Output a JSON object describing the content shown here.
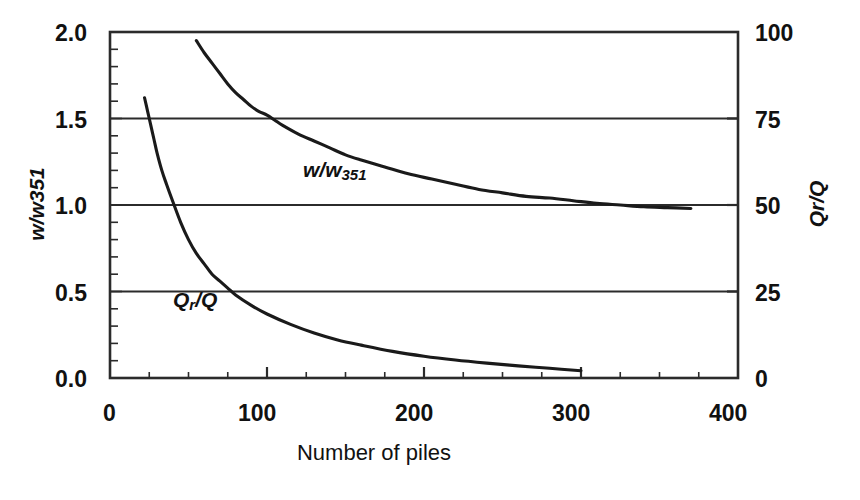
{
  "chart_data": {
    "type": "line",
    "title": "",
    "xlabel": "Number of piles",
    "ylabel_left": "w/w351",
    "ylabel_right": "Qr/Q",
    "xlim": [
      0,
      400
    ],
    "ylim_left": [
      0.0,
      2.0
    ],
    "ylim_right": [
      0,
      100
    ],
    "xticks": [
      0,
      100,
      200,
      300,
      400
    ],
    "xticklabels": [
      "0",
      "100",
      "200",
      "300",
      "400"
    ],
    "yticks_left": [
      0.0,
      0.5,
      1.0,
      1.5,
      2.0
    ],
    "yticklabels_left": [
      "0.0",
      "0.5",
      "1.0",
      "1.5",
      "2.0"
    ],
    "yticks_right": [
      0,
      25,
      50,
      75,
      100
    ],
    "yticklabels_right": [
      "0",
      "25",
      "50",
      "75",
      "100"
    ],
    "x_minor_tick_step": 25,
    "y_minor_tick_step_left": 0.1,
    "grid": "horizontal gridlines at left-axis 0.5, 1.0, 1.5",
    "gridlines_left": [
      0.5,
      1.0,
      1.5
    ],
    "legend": "inline curve annotations",
    "line_color": "#1a1a1a",
    "axis_color": "#2b2b2b",
    "background": "#ffffff",
    "series": [
      {
        "name": "w/w351",
        "axis": "left",
        "annotation": "w/w351",
        "annotation_x": 150,
        "annotation_y": 1.22,
        "x": [
          55,
          60,
          65,
          70,
          75,
          80,
          85,
          90,
          95,
          100,
          105,
          110,
          120,
          130,
          140,
          150,
          160,
          175,
          190,
          205,
          220,
          235,
          250,
          265,
          280,
          295,
          310,
          325,
          340,
          355,
          370
        ],
        "y": [
          1.95,
          1.88,
          1.82,
          1.76,
          1.7,
          1.65,
          1.61,
          1.57,
          1.54,
          1.52,
          1.49,
          1.46,
          1.41,
          1.37,
          1.33,
          1.29,
          1.26,
          1.22,
          1.18,
          1.15,
          1.12,
          1.09,
          1.07,
          1.05,
          1.04,
          1.025,
          1.01,
          1.0,
          0.99,
          0.985,
          0.98
        ]
      },
      {
        "name": "Qr/Q",
        "axis": "right",
        "annotation": "Qr/Q",
        "annotation_x": 42,
        "annotation_y": 45,
        "x": [
          22,
          24,
          26,
          28,
          30,
          33,
          36,
          40,
          45,
          50,
          55,
          60,
          65,
          70,
          75,
          80,
          90,
          100,
          115,
          130,
          145,
          160,
          180,
          200,
          220,
          240,
          260,
          280,
          300
        ],
        "y": [
          81,
          77,
          73,
          69,
          65,
          60,
          56,
          51,
          45,
          40,
          36,
          33,
          30,
          28,
          26,
          24,
          21,
          18.5,
          15.5,
          13.0,
          11.0,
          9.5,
          7.7,
          6.3,
          5.2,
          4.3,
          3.5,
          2.8,
          2.1
        ]
      }
    ]
  },
  "axes": {
    "left_tick_labels": [
      "2.0",
      "1.5",
      "1.0",
      "0.5",
      "0.0"
    ],
    "right_tick_labels": [
      "100",
      "75",
      "50",
      "25",
      "0"
    ],
    "bottom_tick_labels": [
      "0",
      "100",
      "200",
      "300",
      "400"
    ],
    "left_title": "w/w351",
    "right_title": "Qr/Q",
    "bottom_title": "Number of piles"
  },
  "annotations": {
    "curve1_base": "w/w",
    "curve1_sub": "351",
    "curve2_base": "Q",
    "curve2_sub": "r",
    "curve2_tail": "/Q"
  }
}
